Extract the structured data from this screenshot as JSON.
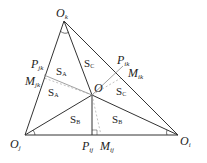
{
  "diagram": {
    "vertices": {
      "top": {
        "base": "O",
        "sub": "k"
      },
      "left": {
        "base": "O",
        "sub": "j"
      },
      "right": {
        "base": "O",
        "sub": "i"
      }
    },
    "interior_point": {
      "base": "O",
      "sub": ""
    },
    "foot_points": {
      "left_edge": {
        "base": "P",
        "sub": "jk"
      },
      "right_edge": {
        "base": "P",
        "sub": "ik"
      },
      "bottom_edge": {
        "base": "P",
        "sub": "ij"
      }
    },
    "midpoints": {
      "left_edge": {
        "base": "M",
        "sub": "jk"
      },
      "right_edge": {
        "base": "M",
        "sub": "ik"
      },
      "bottom_edge": {
        "base": "M",
        "sub": "ij"
      }
    },
    "areas": {
      "A_upper": {
        "base": "S",
        "sub": "A"
      },
      "A_lower": {
        "base": "S",
        "sub": "A"
      },
      "B_left": {
        "base": "S",
        "sub": "B"
      },
      "B_right": {
        "base": "S",
        "sub": "B"
      },
      "C_upper": {
        "base": "S",
        "sub": "C"
      },
      "C_lower": {
        "base": "S",
        "sub": "C"
      }
    },
    "colors": {
      "line": "#333333",
      "dashed": "#888888",
      "text": "#222222"
    }
  }
}
